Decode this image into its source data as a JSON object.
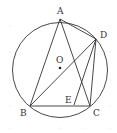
{
  "diagram": {
    "type": "geometry",
    "circle": {
      "center": "O",
      "cx": 60,
      "cy": 70,
      "r": 47.5
    },
    "points": {
      "A": {
        "x": 60,
        "y": 19,
        "label": "A",
        "lx": 57,
        "ly": 14
      },
      "B": {
        "x": 30,
        "y": 106,
        "label": "B",
        "lx": 20,
        "ly": 116
      },
      "C": {
        "x": 90,
        "y": 106,
        "label": "C",
        "lx": 93,
        "ly": 116
      },
      "D": {
        "x": 96,
        "y": 39,
        "label": "D",
        "lx": 100,
        "ly": 38
      },
      "E": {
        "x": 74,
        "y": 105,
        "label": "E",
        "lx": 65,
        "ly": 103
      },
      "O": {
        "x": 60,
        "y": 68,
        "label": "O",
        "lx": 56,
        "ly": 63
      }
    },
    "segments": [
      "AB",
      "AC",
      "AD",
      "BC",
      "BD",
      "CD",
      "DE"
    ],
    "stroke_color": "#333333",
    "background_dots": true
  }
}
